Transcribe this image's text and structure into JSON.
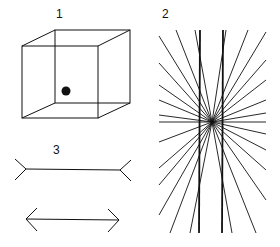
{
  "figure": {
    "panels": [
      {
        "id": "1",
        "label": "1",
        "description": "Necker cube wireframe with a black dot"
      },
      {
        "id": "2",
        "label": "2",
        "description": "Hering illusion: two parallel vertical lines over radiating lines"
      },
      {
        "id": "3",
        "label": "3",
        "description": "Müller-Lyer illusion: line with outward fins above line with inward arrowheads"
      }
    ],
    "colors": {
      "stroke": "#111111",
      "background": "#ffffff"
    }
  }
}
